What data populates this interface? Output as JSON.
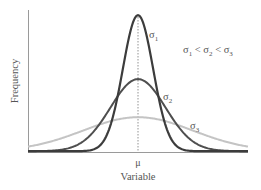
{
  "chart_data": {
    "type": "line",
    "title": "",
    "xlabel": "Variable",
    "ylabel": "Frequency",
    "x_ticks": [
      {
        "position": 0,
        "label": "μ"
      }
    ],
    "grid": false,
    "legend": "none (inline labels)",
    "annotation": "σ₁ < σ₂ < σ₃",
    "mean_marker": {
      "x": 0,
      "style": "dashed vertical line"
    },
    "x_range": [
      -4.0,
      4.0
    ],
    "y_range": [
      0,
      1.0
    ],
    "series": [
      {
        "name": "σ₁",
        "label_sub": "1",
        "sigma": 0.55,
        "peak": 1.0,
        "color": "#3c3c3c",
        "width": 2.2,
        "label_pos": {
          "x": 149,
          "y": 38
        }
      },
      {
        "name": "σ₂",
        "label_sub": "2",
        "sigma": 1.0,
        "peak": 0.53,
        "color": "#4f4f4f",
        "width": 2.0,
        "label_pos": {
          "x": 163,
          "y": 100
        }
      },
      {
        "name": "σ₃",
        "label_sub": "3",
        "sigma": 2.0,
        "peak": 0.25,
        "color": "#c4c4c4",
        "width": 2.0,
        "label_pos": {
          "x": 190,
          "y": 129
        }
      }
    ]
  },
  "labels": {
    "ylabel": "Frequency",
    "xlabel": "Variable",
    "mu": "μ",
    "sigma": "σ",
    "relation": [
      {
        "sym": "σ",
        "sub": "1"
      },
      {
        "op": "<"
      },
      {
        "sym": "σ",
        "sub": "2"
      },
      {
        "op": "<"
      },
      {
        "sym": "σ",
        "sub": "3"
      }
    ]
  }
}
